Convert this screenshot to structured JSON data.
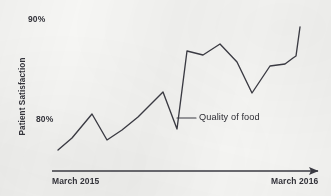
{
  "chart_data": {
    "type": "line",
    "title": "",
    "subtitle": "",
    "xlabel": "",
    "ylabel": "Patient Satisfaction",
    "ylim": [
      75.5,
      90.8
    ],
    "ytick_labels": [
      "90%",
      "80%"
    ],
    "ytick_values": [
      90,
      80
    ],
    "xtick_labels": [
      "March 2015",
      "March 2016"
    ],
    "grid": false,
    "legend_position": "none",
    "annotations": [
      {
        "text": "Quality of food",
        "leader_from_x": 177,
        "leader_from_y": 118,
        "leader_to_x": 196,
        "leader_to_y": 118
      }
    ],
    "series": [
      {
        "name": "Quality of food",
        "color": "#3a3a42",
        "x": [
          "2015-03",
          "2015-04",
          "2015-05",
          "2015-06",
          "2015-07",
          "2015-08",
          "2015-09",
          "2015-10",
          "2015-11",
          "2015-12",
          "2016-01",
          "2016-02",
          "2016-03",
          "2016-04",
          "2016-05",
          "2016-06",
          "2016-07",
          "2016-08"
        ],
        "values": [
          76.9,
          78.1,
          80.3,
          77.9,
          78.6,
          79.7,
          82.3,
          78.4,
          86.8,
          86.5,
          87.6,
          85.1,
          81.2,
          83.9,
          84.1,
          87.2,
          86.9,
          89.3
        ],
        "points_px": [
          [
            58,
            150
          ],
          [
            72,
            138
          ],
          [
            92,
            114
          ],
          [
            107,
            140
          ],
          [
            122,
            130
          ],
          [
            138,
            117
          ],
          [
            163,
            92
          ],
          [
            177,
            129
          ],
          [
            187,
            51
          ],
          [
            203,
            55
          ],
          [
            220,
            44
          ],
          [
            237,
            62
          ],
          [
            252,
            93
          ],
          [
            270,
            66
          ],
          [
            285,
            64
          ],
          [
            293,
            58
          ],
          [
            296,
            56
          ],
          [
            300,
            27
          ]
        ]
      }
    ]
  },
  "axis": {
    "y_title": "Patient Satisfaction",
    "y_top_label": "90%",
    "y_bottom_label": "80%",
    "x_start_label": "March 2015",
    "x_end_label": "March 2016"
  },
  "annotation": {
    "label": "Quality of food"
  },
  "colors": {
    "line": "#3a3a42",
    "axis_arrow": "#3a3a42",
    "text": "#33333a",
    "background": "#f6f6f4"
  }
}
